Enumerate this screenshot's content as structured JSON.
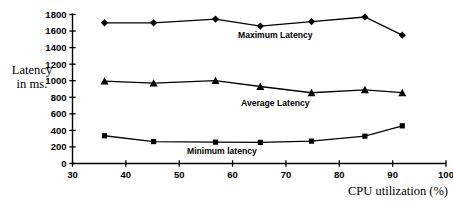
{
  "chart_data": {
    "type": "line",
    "title": "",
    "xlabel": "CPU utilization (%)",
    "ylabel": "Latency in ms.",
    "ylabel_line1": "Latency",
    "ylabel_line2": "in ms.",
    "xlim": [
      30,
      100
    ],
    "ylim": [
      0,
      1800
    ],
    "xticks": [
      30,
      40,
      50,
      60,
      70,
      80,
      90,
      100
    ],
    "yticks": [
      0,
      200,
      400,
      600,
      800,
      1000,
      1200,
      1400,
      1600,
      1800
    ],
    "grid": false,
    "legend": "inline-annotations",
    "line_color": "#000000",
    "series": [
      {
        "name": "Maximum Latency",
        "marker": "diamond",
        "label": "Maximum Latency",
        "label_x": 68,
        "label_y": 1520,
        "x": [
          36,
          45.2,
          56.8,
          65.2,
          74.8,
          84.8,
          91.8
        ],
        "values": [
          1700,
          1700,
          1745,
          1660,
          1715,
          1770,
          1550
        ]
      },
      {
        "name": "Average Latency",
        "marker": "triangle",
        "label": "Average Latency",
        "label_x": 68,
        "label_y": 700,
        "x": [
          36,
          45.2,
          56.8,
          65.2,
          74.8,
          84.8,
          91.8
        ],
        "values": [
          995,
          970,
          1000,
          930,
          855,
          890,
          855
        ]
      },
      {
        "name": "Minimum latency",
        "marker": "square",
        "label": "Minimum latency",
        "label_x": 58,
        "label_y": 120,
        "x": [
          36,
          45.2,
          56.8,
          65.2,
          74.8,
          84.8,
          91.8
        ],
        "values": [
          335,
          265,
          258,
          255,
          270,
          330,
          455
        ]
      }
    ]
  },
  "axes": {
    "x_tick_labels": [
      "30",
      "40",
      "50",
      "60",
      "70",
      "80",
      "90",
      "100"
    ],
    "y_tick_labels": [
      "0",
      "200",
      "400",
      "600",
      "800",
      "1000",
      "1200",
      "1400",
      "1600",
      "1800"
    ],
    "x_axis_title": "CPU utilization (%)",
    "y_axis_title_line1": "Latency",
    "y_axis_title_line2": "in ms."
  }
}
